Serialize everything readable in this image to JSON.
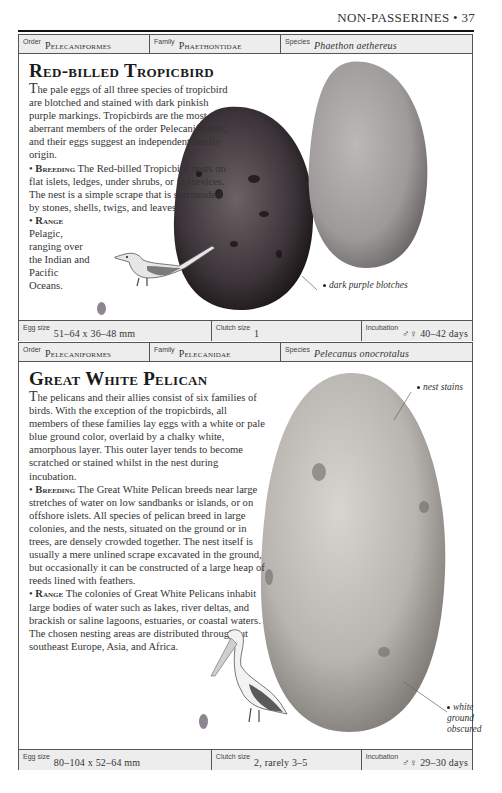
{
  "running_head": "NON-PASSERINES • 37",
  "entries": [
    {
      "header": {
        "order_label": "Order",
        "order": "Pelecaniformes",
        "family_label": "Family",
        "family": "Phaethontidae",
        "species_label": "Species",
        "species": "Phaethon aethereus"
      },
      "title": "Red-billed Tropicbird",
      "intro_dropcap": "T",
      "intro": "he pale eggs of all three species of tropicbird are blotched and stained with dark pinkish purple markings. Tropicbirds are the most aberrant members of the order Pelecaniformes, and their eggs suggest an independent family origin.",
      "breeding_label": "Breeding",
      "breeding": "The Red-billed Tropicbird nests on flat islets, ledges, under shrubs, or in crevices. The nest is a simple scrape that is surrounded by stones, shells, twigs, and leaves.",
      "range_label": "Range",
      "range": "Pelagic, ranging over the Indian and Pacific Oceans.",
      "callouts": [
        "dark purple blotches"
      ],
      "footer": {
        "egg_size_label": "Egg size",
        "egg_size": "51–64 x 36–48 mm",
        "clutch_label": "Clutch size",
        "clutch": "1",
        "incubation_label": "Incubation",
        "incubation": "♂♀ 40–42 days"
      },
      "colors": {
        "egg_dark": "#3a3236",
        "egg_light": "#a8a4a4"
      }
    },
    {
      "header": {
        "order_label": "Order",
        "order": "Pelecaniformes",
        "family_label": "Family",
        "family": "Pelecanidae",
        "species_label": "Species",
        "species": "Pelecanus onocrotalus"
      },
      "title": "Great White Pelican",
      "intro_dropcap": "T",
      "intro": "he pelicans and their allies consist of six families of birds. With the exception of the tropicbirds, all members of these families lay eggs with a white or pale blue ground color, overlaid by a chalky white, amorphous layer. This outer layer tends to become scratched or stained whilst in the nest during incubation.",
      "breeding_label": "Breeding",
      "breeding": "The Great White Pelican breeds near large stretches of water on low sandbanks or islands, or on offshore islets. All species of pelican breed in large colonies, and the nests, situated on the ground or in trees, are densely crowded together. The nest itself is usually a mere unlined scrape excavated in the ground, but occasionally it can be constructed of a large heap of reeds lined with feathers.",
      "range_label": "Range",
      "range": "The colonies of Great White Pelicans inhabit large bodies of water such as lakes, river deltas, and brackish or saline lagoons, estuaries, or coastal waters. The chosen nesting areas are distributed throughout southeast Europe, Asia, and Africa.",
      "callouts": [
        "nest stains",
        "white ground obscured"
      ],
      "footer": {
        "egg_size_label": "Egg size",
        "egg_size": "80–104 x 52–64 mm",
        "clutch_label": "Clutch size",
        "clutch": "2, rarely 3–5",
        "incubation_label": "Incubation",
        "incubation": "♂♀ 29–30 days"
      },
      "colors": {
        "egg": "#bdbab6"
      }
    }
  ]
}
